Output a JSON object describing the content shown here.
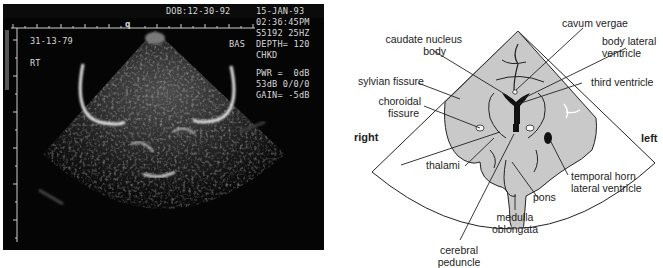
{
  "ultrasound": {
    "header": {
      "dob": "DOB:12-30-92",
      "date": "15-JAN-93",
      "time": "02:36:45PM",
      "probe": "S5192 25HZ",
      "bas": "BAS",
      "depth": "DEPTH= 120",
      "chkd": "CHKD",
      "pwr": "PWR =  0dB",
      "db": "53dB 0/0/0",
      "gain": "GAIN= -5dB",
      "id": "31-13-79",
      "side": "RT",
      "marker": "q"
    }
  },
  "diagram": {
    "orientation": {
      "right": "right",
      "left": "left"
    },
    "labels": {
      "cavum_vergae": "cavum vergae",
      "caudate_1": "caudate nucleus",
      "caudate_2": "body",
      "body_lv_1": "body lateral",
      "body_lv_2": "ventricle",
      "sylvian": "sylvian fissure",
      "third_ventricle": "third ventricle",
      "choroidal_1": "choroidal",
      "choroidal_2": "fissure",
      "thalami": "thalami",
      "temporal_1": "temporal horn",
      "temporal_2": "lateral ventricle",
      "pons": "pons",
      "medulla_1": "medulla",
      "medulla_2": "oblongata",
      "cerebral_1": "cerebral",
      "cerebral_2": "peduncle"
    },
    "colors": {
      "tissue": "#c9c9c9",
      "outline": "#222222",
      "ventricle": "#111111"
    }
  }
}
